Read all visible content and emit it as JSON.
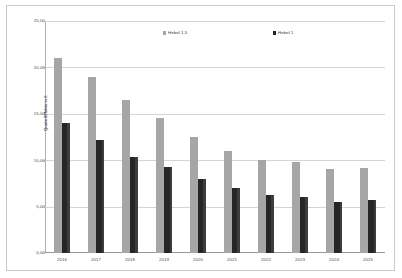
{
  "chart_data": {
    "type": "bar",
    "title": "",
    "subtitle": "",
    "xlabel": "",
    "ylabel": "Quote Effekte in €",
    "categories": [
      "2016",
      "2017",
      "2018",
      "2019",
      "2020",
      "2021",
      "2022",
      "2023",
      "2024",
      "2025"
    ],
    "series": [
      {
        "name": "Hebel 1,5",
        "color": "#a6a6a6",
        "values": [
          21.0,
          19.0,
          16.5,
          14.5,
          12.5,
          11.0,
          10.0,
          9.8,
          9.0,
          9.2
        ]
      },
      {
        "name": "Hebel 1",
        "color": "#262626",
        "values": [
          14.0,
          12.2,
          10.3,
          9.3,
          8.0,
          7.0,
          6.3,
          6.0,
          5.5,
          5.7
        ]
      }
    ],
    "ylim": [
      0,
      25
    ],
    "ytick_values": [
      0,
      5,
      10,
      15,
      20,
      25
    ],
    "ytick_labels": [
      "0,00",
      "5,00",
      "10,00",
      "15,00",
      "20,00",
      "25,00"
    ],
    "grid": true,
    "grid_axis": "y",
    "legend_position": "top-inside",
    "plot_background": "#ffffff",
    "gridline_color": "#d4d4d4",
    "axis_color": "#b0b0b0",
    "border_color": "#c9c9c9"
  }
}
